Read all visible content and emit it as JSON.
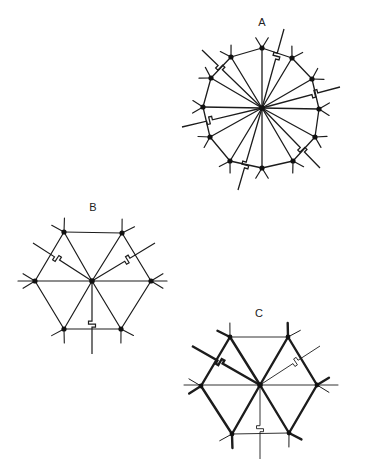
{
  "figures": [
    {
      "id": "A",
      "label": "A",
      "label_pos": [
        262,
        22
      ],
      "center": [
        262,
        108
      ],
      "vertices": [
        [
          262,
          48
        ],
        [
          292,
          58
        ],
        [
          312,
          79
        ],
        [
          319,
          109
        ],
        [
          315,
          137
        ],
        [
          293,
          161
        ],
        [
          262,
          168
        ],
        [
          230,
          161
        ],
        [
          210,
          137
        ],
        [
          203,
          107
        ],
        [
          211,
          78
        ],
        [
          231,
          57
        ]
      ],
      "edges": [
        [
          0,
          1
        ],
        [
          1,
          2
        ],
        [
          2,
          3
        ],
        [
          3,
          4
        ],
        [
          4,
          5
        ],
        [
          5,
          6
        ],
        [
          6,
          7
        ],
        [
          7,
          8
        ],
        [
          8,
          9
        ],
        [
          9,
          10
        ],
        [
          10,
          11
        ],
        [
          11,
          0
        ]
      ],
      "spokes": [
        0,
        1,
        2,
        3,
        4,
        5,
        6,
        7,
        8,
        9,
        10,
        11
      ],
      "bent_spokes": [
        {
          "from": [
            262,
            108
          ],
          "to": [
            284,
            29
          ],
          "kink": 0.62
        },
        {
          "from": [
            262,
            108
          ],
          "to": [
            340,
            87
          ],
          "kink": 0.64
        },
        {
          "from": [
            262,
            108
          ],
          "to": [
            320,
            168
          ],
          "kink": 0.66
        },
        {
          "from": [
            262,
            108
          ],
          "to": [
            238,
            190
          ],
          "kink": 0.66
        },
        {
          "from": [
            262,
            108
          ],
          "to": [
            182,
            127
          ],
          "kink": 0.62
        },
        {
          "from": [
            262,
            108
          ],
          "to": [
            202,
            50
          ],
          "kink": 0.66
        }
      ],
      "stub_len": 12,
      "weights": {
        "edge": 1.3,
        "spoke": 1.3,
        "bent": 1.3,
        "stub": 1.2
      }
    },
    {
      "id": "B",
      "label": "B",
      "label_pos": [
        93,
        207
      ],
      "center": [
        92,
        281
      ],
      "vertices": [
        [
          64,
          232
        ],
        [
          122,
          233
        ],
        [
          151,
          281
        ],
        [
          121,
          329
        ],
        [
          64,
          329
        ],
        [
          35,
          281
        ]
      ],
      "edges": [
        [
          0,
          1
        ],
        [
          1,
          2
        ],
        [
          2,
          3
        ],
        [
          3,
          4
        ],
        [
          4,
          5
        ],
        [
          5,
          0
        ]
      ],
      "spokes": [
        0,
        1,
        3,
        4
      ],
      "through_line": [
        [
          18,
          281
        ],
        [
          167,
          281
        ]
      ],
      "bent_spokes": [
        {
          "from": [
            92,
            281
          ],
          "to": [
            155,
            243
          ],
          "kink": 0.52
        },
        {
          "from": [
            92,
            281
          ],
          "to": [
            33,
            243
          ],
          "kink": 0.55
        },
        {
          "from": [
            92,
            281
          ],
          "to": [
            92,
            354
          ],
          "kink": 0.55
        }
      ],
      "stub_len": 14,
      "weights": {
        "edge": 1.2,
        "spoke": 1.2,
        "bent": 1.2,
        "stub": 1.1
      }
    },
    {
      "id": "C",
      "label": "C",
      "label_pos": [
        259,
        313
      ],
      "center": [
        260,
        385
      ],
      "vertices": [
        [
          230,
          337
        ],
        [
          288,
          337
        ],
        [
          317,
          385
        ],
        [
          289,
          433
        ],
        [
          232,
          434
        ],
        [
          201,
          386
        ]
      ],
      "edges_thin": [
        [
          0,
          1
        ],
        [
          3,
          4
        ]
      ],
      "edges_thick": [
        [
          0,
          5
        ],
        [
          1,
          2
        ],
        [
          2,
          3
        ],
        [
          4,
          5
        ]
      ],
      "spokes_thick": [
        0,
        1,
        3,
        4
      ],
      "through_line": [
        [
          184,
          385
        ],
        [
          338,
          385
        ]
      ],
      "bent_spokes": [
        {
          "from": [
            260,
            385
          ],
          "to": [
            192,
            346
          ],
          "kink": 0.55,
          "thick": true
        },
        {
          "from": [
            260,
            385
          ],
          "to": [
            320,
            346
          ],
          "kink": 0.55,
          "thick": false
        },
        {
          "from": [
            260,
            385
          ],
          "to": [
            260,
            459
          ],
          "kink": 0.55,
          "thick": false
        }
      ],
      "stub_len": 14,
      "weights": {
        "thin": 0.9,
        "thick": 2.4,
        "stub_thick": 2.4,
        "stub_thin": 1.0
      }
    }
  ],
  "colors": {
    "line": "#1c1c1c",
    "node": "#111111",
    "bg": "#ffffff"
  }
}
